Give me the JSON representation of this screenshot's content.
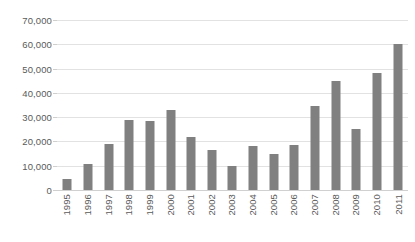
{
  "chart_data": {
    "type": "bar",
    "title": "",
    "subtitle": "",
    "xlabel": "",
    "ylabel": "",
    "categories": [
      "1995",
      "1996",
      "1997",
      "1998",
      "1999",
      "2000",
      "2001",
      "2002",
      "2003",
      "2004",
      "2005",
      "2006",
      "2007",
      "2008",
      "2009",
      "2010",
      "2011"
    ],
    "values": [
      4500,
      10800,
      18800,
      29000,
      28300,
      33000,
      22000,
      16500,
      10000,
      18000,
      14800,
      18500,
      34500,
      45000,
      25300,
      48000,
      60000
    ],
    "series": [
      {
        "name": "",
        "values": [
          4500,
          10800,
          18800,
          29000,
          28300,
          33000,
          22000,
          16500,
          10000,
          18000,
          14800,
          18500,
          34500,
          45000,
          25300,
          48000,
          60000
        ]
      }
    ],
    "ylim": [
      0,
      70000
    ],
    "ytick_values": [
      0,
      10000,
      20000,
      30000,
      40000,
      50000,
      60000,
      70000
    ],
    "ytick_labels": [
      "0",
      "10,000",
      "20,000",
      "30,000",
      "40,000",
      "50,000",
      "60,000",
      "70,000"
    ],
    "grid": true,
    "legend": false,
    "legend_position": "none",
    "xtick_rotation": -90,
    "colors": {
      "bar": "#808080",
      "gridline": "#e2e2e2",
      "axis": "#d0d0d0",
      "tick_text": "#5a5a5a",
      "background": "#ffffff"
    }
  }
}
